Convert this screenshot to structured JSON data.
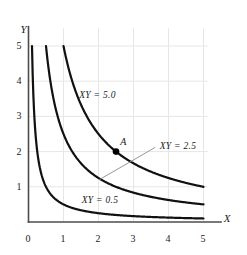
{
  "chart_data": {
    "type": "line",
    "title": "",
    "xlabel": "X",
    "ylabel": "Y",
    "xlim": [
      0,
      5.35
    ],
    "ylim": [
      0,
      5.6
    ],
    "grid": true,
    "legend": "inline-curve-labels",
    "xticks": [
      "0",
      "1",
      "2",
      "3",
      "4",
      "5"
    ],
    "xtick_values": [
      0,
      1,
      2,
      3,
      4,
      5
    ],
    "yticks": [
      "1",
      "2",
      "3",
      "4",
      "5"
    ],
    "ytick_values": [
      1,
      2,
      3,
      4,
      5
    ],
    "series": [
      {
        "name": "XY = 5.0",
        "label": "XY = 5.0",
        "constant": 5.0,
        "equation": "Y = 5.0 / X",
        "x_start": 1.0,
        "x_end": 5.0,
        "y_start": 5.0,
        "y_end": 1.0,
        "label_x": 1.45,
        "label_y": 3.72
      },
      {
        "name": "XY = 2.5",
        "label": "XY = 2.5",
        "constant": 2.5,
        "equation": "Y = 2.5 / X",
        "x_start": 0.5,
        "x_end": 5.0,
        "y_start": 5.0,
        "y_end": 0.5,
        "label_x": 3.75,
        "label_y": 2.27,
        "leader_line": {
          "x1": 3.62,
          "y1": 2.12,
          "x2": 2.02,
          "y2": 1.2
        }
      },
      {
        "name": "XY = 0.5",
        "label": "XY = 0.5",
        "constant": 0.5,
        "equation": "Y = 0.5 / X",
        "x_start": 0.1,
        "x_end": 5.0,
        "y_start": 5.0,
        "y_end": 0.1,
        "label_x": 1.52,
        "label_y": 0.73
      }
    ],
    "annotations": [
      {
        "label": "A",
        "x": 2.5,
        "y": 2.0,
        "marker": "filled-circle",
        "on_series": "XY = 2.5",
        "label_offset_x": 0.12,
        "label_offset_y": 0.42
      }
    ],
    "colors": {
      "curve": "#111111",
      "axis": "#4d4d4d",
      "grid": "#e6e6e6",
      "text": "#1a1a1a",
      "marker": "#000000",
      "leader": "#8c8c8c"
    }
  }
}
